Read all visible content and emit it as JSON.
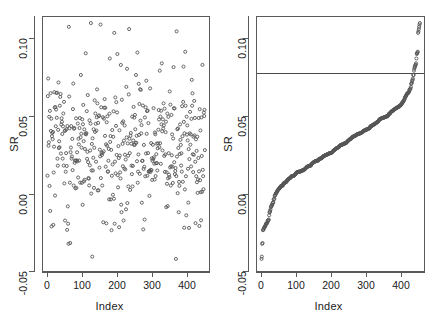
{
  "figure": {
    "panels": [
      {
        "id": "raw",
        "name": "unsorted-scatter",
        "xlabel": "Index",
        "ylabel": "SR",
        "xticks": [
          "0",
          "100",
          "200",
          "300",
          "400"
        ],
        "yticks": [
          "-0.05",
          "0.00",
          "0.05",
          "0.10"
        ]
      },
      {
        "id": "sorted",
        "name": "sorted-scatter",
        "xlabel": "Index",
        "ylabel": "SR",
        "xticks": [
          "0",
          "100",
          "200",
          "300",
          "400"
        ],
        "yticks": [
          "-0.05",
          "0.00",
          "0.05",
          "0.10"
        ]
      }
    ],
    "point_color": "#555555",
    "line_color": "#4a4a4a",
    "frame_color": "#5a5a5a"
  },
  "chart_data": [
    {
      "type": "scatter",
      "title": "",
      "xlabel": "Index",
      "ylabel": "SR",
      "xlim": [
        -12,
        470
      ],
      "ylim": [
        -0.056,
        0.112
      ],
      "xticks": [
        0,
        100,
        200,
        300,
        400
      ],
      "yticks": [
        -0.05,
        0.0,
        0.05,
        0.1
      ],
      "grid": false,
      "legend": null,
      "marker": "open-circle",
      "n_points": 458,
      "series": [
        {
          "name": "SR by index (unsorted)",
          "x": [
            2,
            4,
            5,
            7,
            8,
            10,
            11,
            13,
            14,
            16,
            17,
            19,
            20,
            22,
            23,
            25,
            26,
            28,
            29,
            31,
            32,
            34,
            35,
            37,
            38,
            40,
            41,
            43,
            44,
            46,
            47,
            49,
            50,
            52,
            53,
            55,
            56,
            58,
            59,
            61,
            62,
            64,
            65,
            67,
            68,
            70,
            71,
            73,
            74,
            76,
            77,
            79,
            80,
            82,
            83,
            85,
            86,
            88,
            89,
            91,
            92,
            94,
            95,
            97,
            98,
            100,
            101,
            103,
            104,
            106,
            107,
            109,
            110,
            112,
            113,
            115,
            116,
            118,
            119,
            121,
            122,
            124,
            125,
            127,
            128,
            130,
            131,
            133,
            134,
            136,
            137,
            139,
            140,
            142,
            143,
            145,
            146,
            148,
            149,
            151,
            152,
            154,
            155,
            157,
            158,
            160,
            161,
            163,
            164,
            166,
            167,
            169,
            170,
            172,
            173,
            175,
            176,
            178,
            179,
            181,
            182,
            184,
            185,
            187,
            188,
            190,
            191,
            193,
            194,
            196,
            197,
            199,
            200,
            202,
            203,
            205,
            206,
            208,
            209,
            211,
            212,
            214,
            215,
            217,
            218,
            220,
            221,
            223,
            224,
            226,
            227,
            229,
            230,
            232,
            233,
            235,
            236,
            238,
            239,
            241,
            242,
            244,
            245,
            247,
            248,
            250,
            251,
            253,
            254,
            256,
            257,
            259,
            260,
            262,
            263,
            265,
            266,
            268,
            269,
            271,
            272,
            274,
            275,
            277,
            278,
            280,
            281,
            283,
            284,
            286,
            287,
            289,
            290,
            292,
            293,
            295,
            296,
            298,
            299,
            301,
            302,
            304,
            305,
            307,
            308,
            310,
            311,
            313,
            314,
            316,
            317,
            319,
            320,
            322,
            323,
            325,
            326,
            328,
            329,
            331,
            332,
            334,
            335,
            337,
            338,
            340,
            341,
            343,
            344,
            346,
            347,
            349,
            350,
            352,
            353,
            355,
            356,
            358,
            359,
            361,
            362,
            364,
            365,
            367,
            368,
            370,
            371,
            373,
            374,
            376,
            377,
            379,
            380,
            382,
            383,
            385,
            386,
            388,
            389,
            391,
            392,
            394,
            395,
            397,
            398,
            400,
            401,
            403,
            404,
            406,
            407,
            409,
            410,
            412,
            413,
            415,
            416,
            418,
            419,
            421,
            422,
            424,
            425,
            427,
            428,
            430,
            431,
            433,
            434,
            436,
            437,
            439,
            440,
            442,
            443,
            445,
            446,
            448,
            449,
            451,
            452,
            454,
            455,
            457
          ],
          "y_note": "Sharpe-ratio values scattered between -0.050 and 0.108, dense band 0.00-0.07, mean about 0.025"
        }
      ],
      "annotations": []
    },
    {
      "type": "scatter",
      "title": "",
      "xlabel": "Index",
      "ylabel": "SR",
      "xlim": [
        -12,
        470
      ],
      "ylim": [
        -0.056,
        0.112
      ],
      "xticks": [
        0,
        100,
        200,
        300,
        400
      ],
      "yticks": [
        -0.05,
        0.0,
        0.05,
        0.1
      ],
      "grid": false,
      "legend": null,
      "marker": "open-circle",
      "n_points": 458,
      "series": [
        {
          "name": "SR sorted ascending",
          "y_note": "Monotonically increasing curve from about -0.048 at index 1 to about 0.108 at index 458; steep rise over first 40 indices, near-linear middle, steep rise after index 420",
          "y_min": -0.048,
          "y_max": 0.108,
          "y_median": 0.023
        }
      ],
      "annotations": [
        {
          "type": "hline",
          "name": "threshold-line",
          "y": 0.075,
          "label": ""
        }
      ]
    }
  ]
}
